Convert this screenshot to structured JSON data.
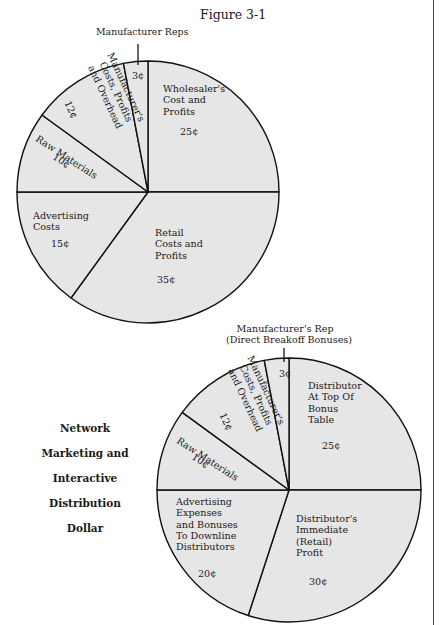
{
  "figure_title": "Figure 3-1",
  "side_caption": [
    "Network",
    "Marketing and",
    "Interactive",
    "Distribution",
    "Dollar"
  ],
  "colors": {
    "slice_fill": "#e6e6e6",
    "outline": "#111111",
    "background": "#ffffff"
  },
  "chart_data": [
    {
      "type": "pie",
      "title": "Figure 3-1",
      "unit": "cents (¢) of consumer dollar",
      "start_angle_deg": -90,
      "direction": "clockwise",
      "slices": [
        {
          "label": "Wholesaler's Cost and Profits",
          "value": 25,
          "display": "25¢"
        },
        {
          "label": "Retail Costs and Profits",
          "value": 35,
          "display": "35¢"
        },
        {
          "label": "Advertising Costs",
          "value": 15,
          "display": "15¢"
        },
        {
          "label": "Raw Materials",
          "value": 10,
          "display": "10¢"
        },
        {
          "label": "Manufacturer's Costs, Profits and Overhead",
          "value": 12,
          "display": "12¢"
        },
        {
          "label": "Manufacturer Reps",
          "value": 3,
          "display": "3¢"
        }
      ]
    },
    {
      "type": "pie",
      "title": "Network Marketing and Interactive Distribution Dollar",
      "unit": "cents (¢)",
      "start_angle_deg": -90,
      "direction": "clockwise",
      "slices": [
        {
          "label": "Distributor At Top Of Bonus Table",
          "value": 25,
          "display": "25¢"
        },
        {
          "label": "Distributor's Immediate (Retail) Profit",
          "value": 30,
          "display": "30¢"
        },
        {
          "label": "Advertising Expenses and Bonuses To Downline Distributors",
          "value": 20,
          "display": "20¢"
        },
        {
          "label": "Raw Materials",
          "value": 10,
          "display": "10¢"
        },
        {
          "label": "Manufacturer's Costs, Profits and Overhead",
          "value": 12,
          "display": "12¢"
        },
        {
          "label": "Manufacturer's Rep (Direct Breakoff Bonuses)",
          "value": 3,
          "display": "3¢"
        }
      ]
    }
  ],
  "pie1_labels": {
    "reps_callout": "Manufacturer Reps",
    "reps_value": "3¢",
    "wholesaler": [
      "Wholesaler's",
      "Cost and",
      "Profits"
    ],
    "wholesaler_value": "25¢",
    "mfr": [
      "Manufacturer's",
      "Costs, Profits",
      "and Overhead"
    ],
    "mfr_value": "12¢",
    "raw": "Raw Materials",
    "raw_value": "10¢",
    "adv": [
      "Advertising",
      "Costs"
    ],
    "adv_value": "15¢",
    "retail": [
      "Retail",
      "Costs and",
      "Profits"
    ],
    "retail_value": "35¢"
  },
  "pie2_labels": {
    "rep_callout": [
      "Manufacturer's Rep",
      "(Direct Breakoff Bonuses)"
    ],
    "rep_value": "3¢",
    "top": [
      "Distributor",
      "At  Top Of",
      "Bonus",
      "Table"
    ],
    "top_value": "25¢",
    "mfr": [
      "Manufacturer's",
      "Costs, Profits",
      "and Overhead"
    ],
    "mfr_value": "12¢",
    "raw": "Raw Materials",
    "raw_value": "10¢",
    "adv": [
      "Advertising",
      "Expenses",
      "and Bonuses",
      "To Downline",
      "Distributors"
    ],
    "adv_value": "20¢",
    "retail": [
      "Distributor's",
      "Immediate",
      "(Retail)",
      "Profit"
    ],
    "retail_value": "30¢"
  }
}
